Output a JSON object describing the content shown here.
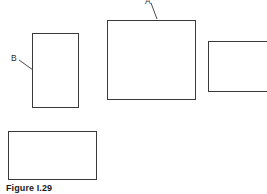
{
  "figure": {
    "caption": "Figure I.29",
    "background_color": "#ffffff",
    "stroke_color": "#3a3a3a",
    "text_color": "#2b2b2b",
    "caption_color": "#1b1b1b",
    "width": 267,
    "height": 194
  },
  "labels": [
    {
      "id": "a",
      "text": "A",
      "x": 145,
      "y": -3,
      "note": "cut off at top edge of image"
    },
    {
      "id": "b",
      "text": "B",
      "x": 11,
      "y": 54
    }
  ],
  "leaders": [
    {
      "id": "leader-a",
      "from_label": "A",
      "x1": 151,
      "y1": 3,
      "x2": 157,
      "y2": 19
    },
    {
      "id": "leader-b",
      "from_label": "B",
      "x1": 19,
      "y1": 60,
      "x2": 33,
      "y2": 70
    }
  ],
  "shapes": [
    {
      "id": "rect-b-tall",
      "name": "tall-rectangle",
      "x": 32,
      "y": 33,
      "width": 47,
      "height": 75,
      "labelled_by": "B"
    },
    {
      "id": "rect-a-large",
      "name": "large-square",
      "x": 107,
      "y": 20,
      "width": 89,
      "height": 80,
      "labelled_by": "A"
    },
    {
      "id": "rect-right",
      "name": "right-rectangle",
      "x": 208,
      "y": 41,
      "width": 62,
      "height": 51,
      "labelled_by": null,
      "note": "clipped by right image edge"
    },
    {
      "id": "rect-bottom-left",
      "name": "bottom-left-rectangle",
      "x": 8,
      "y": 131,
      "width": 89,
      "height": 49,
      "labelled_by": null
    }
  ],
  "caption_position": {
    "x": 6,
    "y": 184
  }
}
